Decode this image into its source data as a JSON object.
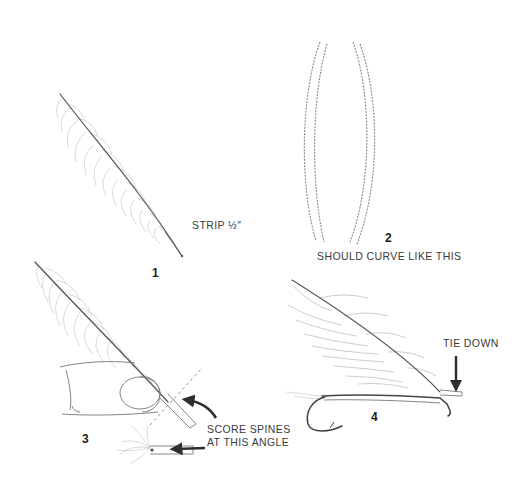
{
  "figure": {
    "steps": [
      {
        "number": "1",
        "caption": "STRIP ½″"
      },
      {
        "number": "2",
        "caption": "SHOULD CURVE LIKE THIS"
      },
      {
        "number": "3",
        "caption_line1": "SCORE SPINES",
        "caption_line2": "AT THIS ANGLE"
      },
      {
        "number": "4",
        "caption": "TIE DOWN"
      }
    ]
  },
  "colors": {
    "ink": "#3a3a3a",
    "background": "#ffffff",
    "arrow": "#2e2e2e"
  }
}
